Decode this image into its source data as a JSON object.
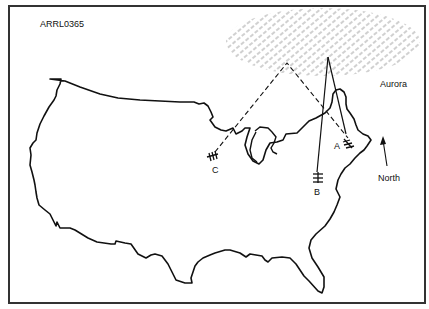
{
  "figure": {
    "id_label": "ARRL0365",
    "aurora_label": "Aurora",
    "north_label": "North",
    "stations": [
      {
        "id": "A",
        "label": "A"
      },
      {
        "id": "B",
        "label": "B"
      },
      {
        "id": "C",
        "label": "C"
      }
    ],
    "colors": {
      "outline": "#111111",
      "frame": "#333333",
      "hatch": "#9a9a9a"
    }
  }
}
